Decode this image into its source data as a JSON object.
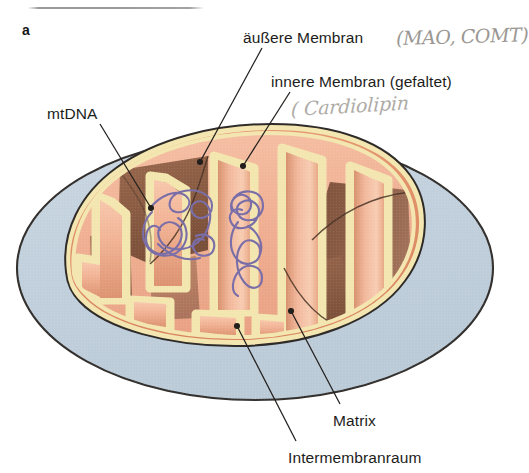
{
  "figure": {
    "panel_letter": "a",
    "background_color": "#ffffff"
  },
  "labels": {
    "outer_membrane": "äußere Membran",
    "inner_membrane": "innere Membran (gefaltet)",
    "mtdna": "mtDNA",
    "matrix": "Matrix",
    "intermembrane_space": "Intermembranraum"
  },
  "annotations": {
    "handwritten_mao_comt": "(MAO, COMT)",
    "handwritten_cardiolipin": "( Cardiolipin",
    "pencil_underline": true
  },
  "colors": {
    "cytoplasm_blue": "#c3d2de",
    "outer_membrane_cream": "#f0e2ab",
    "intermembrane_salmon": "#e2906c",
    "matrix_light": "#f3b698",
    "crista_shadow_brown": "#8a5b44",
    "mtdna_purple": "#7a6ea8",
    "outline_dark": "#2b2724",
    "label_text": "#1d1d1b",
    "pencil_gray": "#938f8a"
  },
  "leader_lines": [
    {
      "name": "outer-membrane-leader",
      "from": [
        262,
        48
      ],
      "to": [
        200,
        162
      ]
    },
    {
      "name": "inner-membrane-leader",
      "from": [
        290,
        92
      ],
      "to": [
        243,
        166
      ]
    },
    {
      "name": "mtdna-leader",
      "from": [
        100,
        124
      ],
      "to": [
        150,
        207
      ]
    },
    {
      "name": "matrix-leader",
      "from": [
        340,
        404
      ],
      "to": [
        291,
        311
      ]
    },
    {
      "name": "intermembrane-leader",
      "from": [
        296,
        441
      ],
      "to": [
        237,
        326
      ]
    }
  ]
}
